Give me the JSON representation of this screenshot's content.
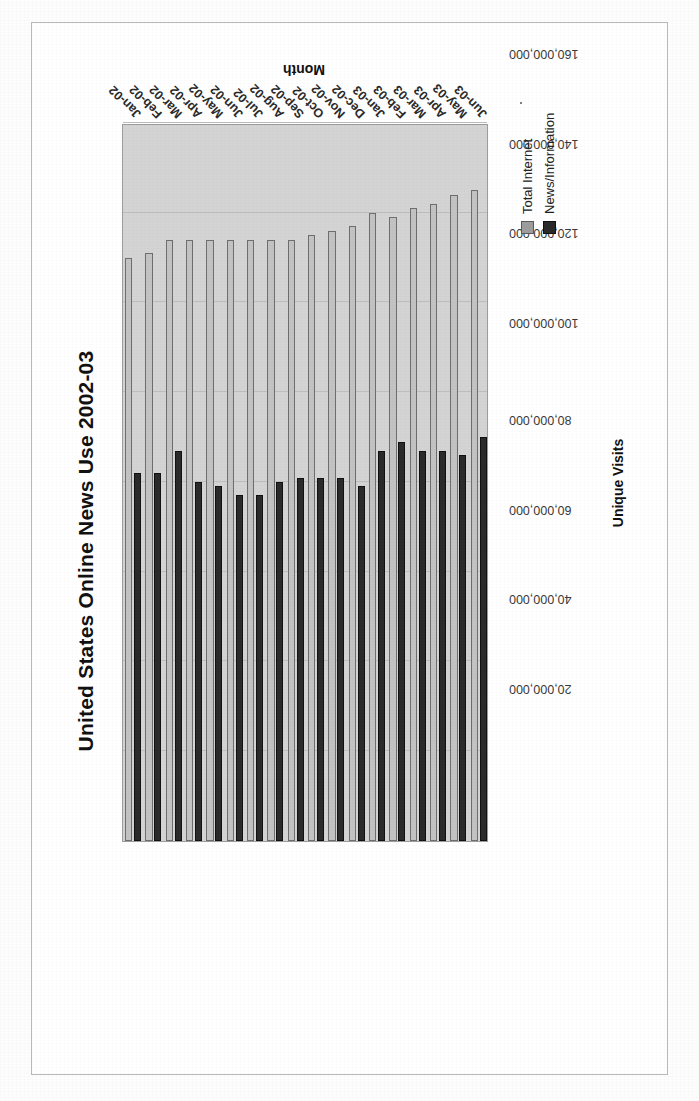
{
  "chart_data": {
    "type": "bar",
    "orientation": "horizontal",
    "title": "United States Online News Use 2002-03",
    "xlabel": "Month",
    "ylabel": "Unique Visits",
    "grid": true,
    "legend_position": "bottom-right",
    "value_axis_range": [
      0,
      160000000
    ],
    "value_axis_step": 20000000,
    "value_tick_labels": [
      "160,000,000",
      "140,000,000",
      "120,000,000",
      "100,000,000",
      "80,000,000",
      "60,000,000",
      "40,000,000",
      "20,000,000"
    ],
    "categories": [
      "Jan-02",
      "Feb-02",
      "Mar-02",
      "Apr-02",
      "May-02",
      "Jun-02",
      "Jul-02",
      "Aug-02",
      "Sep-02",
      "Oct-02",
      "Nov-02",
      "Dec-02",
      "Jan-03",
      "Feb-03",
      "Mar-03",
      "Apr-03",
      "May-03",
      "Jun-03"
    ],
    "series": [
      {
        "name": "Total Internet",
        "color": "#c3c3c3",
        "values": [
          130000000,
          131000000,
          134000000,
          134000000,
          134000000,
          134000000,
          134000000,
          134000000,
          134000000,
          135000000,
          136000000,
          137000000,
          140000000,
          139000000,
          141000000,
          142000000,
          144000000,
          145000000
        ]
      },
      {
        "name": "News/Information",
        "color": "#2b2b2b",
        "values": [
          82000000,
          82000000,
          87000000,
          80000000,
          79000000,
          77000000,
          77000000,
          80000000,
          81000000,
          81000000,
          81000000,
          79000000,
          87000000,
          89000000,
          87000000,
          87000000,
          86000000,
          90000000
        ]
      }
    ]
  },
  "legend": {
    "items": [
      {
        "label": "Total Internet"
      },
      {
        "label": "News/Information"
      }
    ]
  },
  "colors": {
    "total_internet": "#c3c3c3",
    "news_information": "#2b2b2b",
    "plot_background": "#d4d4d4",
    "gridline": "#bdbdbd",
    "page_border": "#b9b9b9"
  }
}
